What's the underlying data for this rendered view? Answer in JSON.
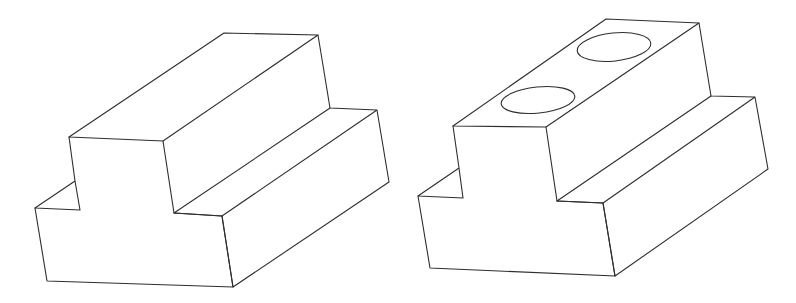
{
  "diagram": {
    "background": "#ffffff",
    "stroke_color": "#2e2e2e",
    "stroke_width": 1.1,
    "figures": [
      {
        "name": "t-block-plain",
        "description": "Isometric T-shaped block without holes",
        "polylines": [
          [
            [
              69,
              137
            ],
            [
              224,
              33
            ],
            [
              318,
              35
            ],
            [
              163,
              141
            ],
            [
              69,
              137
            ]
          ],
          [
            [
              318,
              35
            ],
            [
              330,
              108
            ],
            [
              377,
              110
            ],
            [
              389,
              182
            ],
            [
              233,
              287
            ],
            [
              222,
              216
            ],
            [
              377,
              110
            ]
          ],
          [
            [
              330,
              108
            ],
            [
              174,
              213
            ],
            [
              222,
              216
            ]
          ],
          [
            [
              163,
              141
            ],
            [
              174,
              213
            ]
          ],
          [
            [
              69,
              137
            ],
            [
              75,
              181
            ],
            [
              80,
              210
            ],
            [
              35,
              208
            ],
            [
              75,
              181
            ]
          ],
          [
            [
              35,
              208
            ],
            [
              47,
              281
            ],
            [
              233,
              287
            ],
            [
              222,
              216
            ],
            [
              174,
              213
            ]
          ]
        ],
        "holes": []
      },
      {
        "name": "t-block-with-holes",
        "description": "Isometric T-shaped block with two elliptical holes on top face",
        "polylines": [
          [
            [
              453,
              126
            ],
            [
              606,
              19
            ],
            [
              699,
              23
            ],
            [
              546,
              127
            ],
            [
              453,
              126
            ]
          ],
          [
            [
              699,
              23
            ],
            [
              711,
              96
            ],
            [
              755,
              97
            ],
            [
              768,
              169
            ],
            [
              615,
              276
            ],
            [
              603,
              203
            ],
            [
              755,
              97
            ]
          ],
          [
            [
              711,
              96
            ],
            [
              557,
              201
            ],
            [
              603,
              203
            ]
          ],
          [
            [
              546,
              127
            ],
            [
              557,
              201
            ]
          ],
          [
            [
              453,
              126
            ],
            [
              459,
              168
            ],
            [
              463,
              198
            ],
            [
              418,
              196
            ],
            [
              459,
              168
            ]
          ],
          [
            [
              418,
              196
            ],
            [
              430,
              268
            ],
            [
              615,
              276
            ],
            [
              603,
              203
            ],
            [
              557,
              201
            ]
          ]
        ],
        "holes": [
          {
            "cx": 538,
            "cy": 100,
            "rx": 37,
            "ry": 13,
            "rotate": -6
          },
          {
            "cx": 614,
            "cy": 47,
            "rx": 37,
            "ry": 14,
            "rotate": -6
          }
        ]
      }
    ]
  }
}
